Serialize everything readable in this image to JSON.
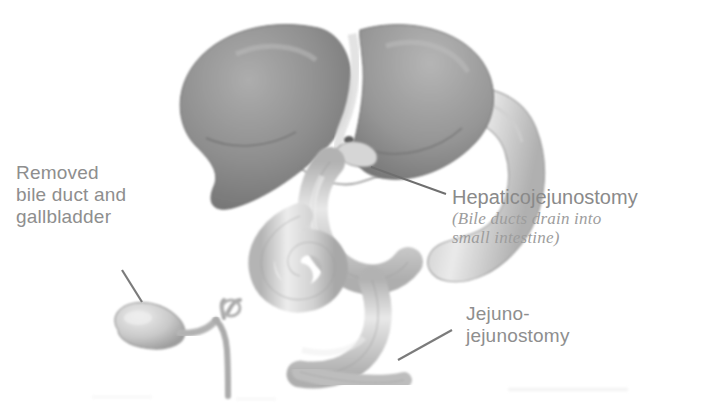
{
  "figure": {
    "background_color": "#ffffff",
    "text_color": "#8e8e8e",
    "width": 719,
    "height": 408
  },
  "labels": {
    "removed": "Removed\nbile duct and\ngallbladder",
    "hepaticojejunostomy_title": "Hepaticojejunostomy",
    "hepaticojejunostomy_subtitle": "(Bile ducts drain into\nsmall intestine)",
    "jejunojejunostomy": "Jejuno-\njejunostomy"
  },
  "anatomy": [
    {
      "name": "liver",
      "tone": "#8f8f8f",
      "description": "Liver with right and left lobes, dark grey shading"
    },
    {
      "name": "liver-left-lobe",
      "tone": "#9a9a9a",
      "description": "Left hepatic lobe"
    },
    {
      "name": "falciform-ligament",
      "tone": "#dcdcdc",
      "description": "Pale fissure between lobes"
    },
    {
      "name": "hepatic-duct-stump",
      "tone": "#c9c9c9",
      "description": "Hepatic duct at porta hepatis"
    },
    {
      "name": "roux-limb-jejunum",
      "tone": "#d2d2d2",
      "description": "Roux-en-Y jejunal limb rising to liver hilum"
    },
    {
      "name": "duodenum",
      "tone": "#cfcfcf",
      "description": "Duodenal sweep on the right"
    },
    {
      "name": "jejunum-loop",
      "tone": "#cccccc",
      "description": "Coiled jejunal loop in the centre"
    },
    {
      "name": "distal-jejunum",
      "tone": "#c8c8c8",
      "description": "Distal jejunum at bottom"
    },
    {
      "name": "excised-gallbladder",
      "tone": "#c4c4c4",
      "description": "Removed pear-shaped gallbladder"
    },
    {
      "name": "excised-cystic-duct",
      "tone": "#b8b8b8",
      "description": "Cystic duct attached to removed gallbladder"
    },
    {
      "name": "excised-common-bile-duct",
      "tone": "#b0b0b0",
      "description": "Removed common bile duct stump"
    }
  ],
  "leader_lines": [
    {
      "name": "leader-removed",
      "from": "gallbladder label",
      "to": "excised gallbladder"
    },
    {
      "name": "leader-hepaticojejunostomy",
      "from": "Hepaticojejunostomy label",
      "to": "biliary-enteric anastomosis"
    },
    {
      "name": "leader-jejunojejunostomy",
      "from": "Jejuno-jejunostomy label",
      "to": "enteroenterostomy junction"
    }
  ]
}
